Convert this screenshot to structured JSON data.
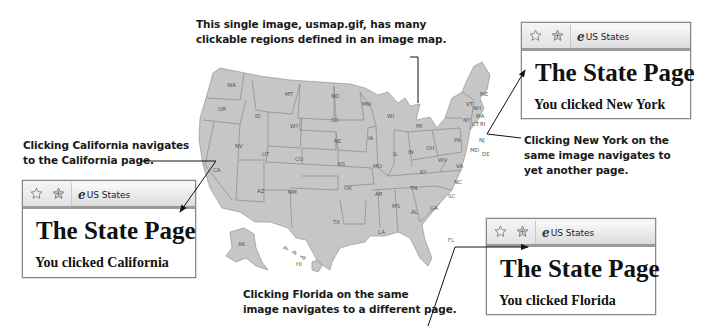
{
  "callouts": {
    "image_map": [
      "This single image, usmap.gif, has many",
      "clickable regions defined in an image map."
    ],
    "california": [
      "Clicking California navigates",
      "to the California page."
    ],
    "new_york": [
      "Clicking New York on the",
      "same image navigates to",
      "yet another page."
    ],
    "florida": [
      "Clicking Florida on the same",
      "image navigates to a different page."
    ]
  },
  "map": {
    "image_name": "usmap.gif",
    "fill_color": "#c6c6c6",
    "border_color": "#7a7a7a",
    "state_labels": [
      "WA",
      "OR",
      "CA",
      "ID",
      "NV",
      "MT",
      "WY",
      "UT",
      "AZ",
      "CO",
      "NM",
      "ND",
      "SD",
      "NE",
      "KS",
      "OK",
      "TX",
      "MN",
      "IA",
      "MO",
      "AR",
      "LA",
      "WI",
      "IL",
      "MI",
      "IN",
      "OH",
      "KY",
      "TN",
      "MS",
      "AL",
      "GA",
      "FL",
      "SC",
      "NC",
      "VA",
      "WV",
      "PA",
      "NY",
      "NJ",
      "DE",
      "MD",
      "ME",
      "VT",
      "NH",
      "MA",
      "CT",
      "RI",
      "AK",
      "HI"
    ]
  },
  "browsers": [
    {
      "id": "california",
      "tab_label": "US States",
      "heading": "The State Page",
      "message": "You clicked California"
    },
    {
      "id": "new_york",
      "tab_label": "US States",
      "heading": "The State Page",
      "message": "You clicked New York"
    },
    {
      "id": "florida",
      "tab_label": "US States",
      "heading": "The State Page",
      "message": "You clicked Florida"
    }
  ],
  "icons": {
    "favorites": "star-icon",
    "add_favorites": "star-plus-icon",
    "page": "ie-page-icon"
  }
}
